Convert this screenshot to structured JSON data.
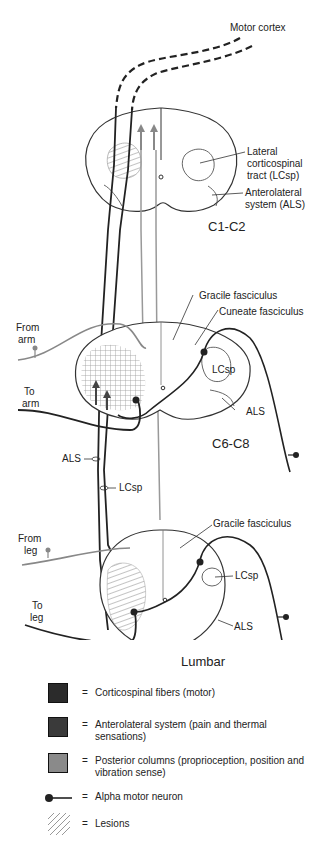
{
  "figure": {
    "labels": {
      "motor_cortex": "Motor cortex",
      "lcsp_full": "Lateral\ncorticospinal\ntract (LCsp)",
      "lcsp_line1": "Lateral",
      "lcsp_line2": "corticospinal",
      "lcsp_line3": "tract (LCsp)",
      "als_line1": "Anterolateral",
      "als_line2": "system (ALS)",
      "gracile_1": "Gracile fasciculus",
      "cuneate": "Cuneate fasciculus",
      "from_arm_1": "From",
      "from_arm_2": "arm",
      "to_arm_1": "To",
      "to_arm_2": "arm",
      "lcsp_c6": "LCsp",
      "als_c6": "ALS",
      "als_tract": "ALS",
      "lcsp_tract": "LCsp",
      "gracile_2": "Gracile fasciculus",
      "from_leg_1": "From",
      "from_leg_2": "leg",
      "to_leg_1": "To",
      "to_leg_2": "leg",
      "lcsp_lumbar": "LCsp",
      "als_lumbar": "ALS"
    },
    "segments": {
      "c1c2": "C1-C2",
      "c6c8": "C6-C8",
      "lumbar": "Lumbar"
    },
    "colors": {
      "corticospinal": "#2b2b2b",
      "anterolateral": "#3a3a3a",
      "posterior": "#8a8a8a",
      "outline": "#333333",
      "lesion_hatch": "#888888"
    }
  },
  "legend": {
    "items": [
      {
        "symbol": "dark-square",
        "eq": "=",
        "text": "Corticospinal fibers (motor)"
      },
      {
        "symbol": "dark-square",
        "eq": "=",
        "text": "Anterolateral system (pain and thermal sensations)"
      },
      {
        "symbol": "gray-square",
        "eq": "=",
        "text": "Posterior columns (proprioception, position and vibration sense)"
      },
      {
        "symbol": "neuron-line",
        "eq": "=",
        "text": "Alpha motor neuron"
      },
      {
        "symbol": "hatch",
        "eq": "=",
        "text": "Lesions"
      }
    ]
  }
}
